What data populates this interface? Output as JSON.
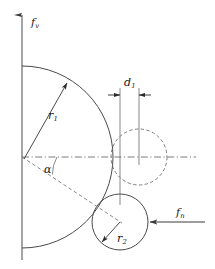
{
  "figure": {
    "background_color": "#ffffff",
    "line_color": "#4a4a4a",
    "dash_color": "#6e6e6e",
    "text_color": "#1a1a1a",
    "width": 215,
    "height": 269
  },
  "labels": {
    "vertical_axis": {
      "symbol": "f",
      "subscript": "v"
    },
    "horizontal_force": {
      "symbol": "f",
      "subscript": "n"
    },
    "radius_large": {
      "symbol": "r",
      "subscript": "1"
    },
    "radius_small": {
      "symbol": "r",
      "subscript": "2"
    },
    "dimension": {
      "symbol": "d",
      "subscript": "1"
    },
    "angle": {
      "symbol": "α"
    }
  },
  "geometry": {
    "origin": {
      "x": 22,
      "y": 157
    },
    "vertical_axis": {
      "x": 22,
      "y_top": 13,
      "y_bottom": 260,
      "arrow": "up"
    },
    "horizontal_axis": {
      "y": 157,
      "x_start": 22,
      "x_end": 196,
      "style": "dash-dot"
    },
    "large_arc": {
      "center_x": 22,
      "center_y": 157,
      "radius": 91,
      "y_top": 66,
      "y_bottom": 248,
      "style": "solid"
    },
    "dashed_circle": {
      "center_x": 139,
      "center_y": 157,
      "radius": 28,
      "style": "dashed"
    },
    "solid_circle": {
      "center_x": 120,
      "center_y": 222,
      "radius": 28,
      "style": "solid"
    },
    "angle_line": {
      "from_x": 22,
      "from_y": 157,
      "to_x": 120,
      "to_y": 222,
      "style": "dashed"
    },
    "radius_leader_large": {
      "from_x": 24,
      "from_y": 159,
      "to_x": 68,
      "to_y": 82,
      "arrow": "end"
    },
    "radius_leader_small": {
      "from_x": 120,
      "from_y": 222,
      "to_x": 101,
      "to_y": 243,
      "arrow": "end"
    },
    "dimension_lines": {
      "left_x": 120,
      "right_x": 139,
      "y_top": 88,
      "y_bottom": 205,
      "dim_line_y": 95
    },
    "force_arrow": {
      "y": 222,
      "x_tail": 205,
      "x_head": 150,
      "direction": "left"
    }
  }
}
